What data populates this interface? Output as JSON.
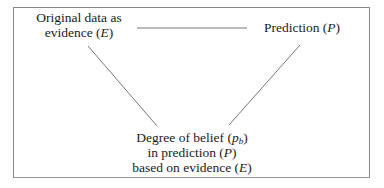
{
  "diagram": {
    "nodes": {
      "evidence": {
        "line1": "Original data as",
        "line2_prefix": "evidence (",
        "line2_var": "E",
        "line2_suffix": ")"
      },
      "prediction": {
        "prefix": "Prediction (",
        "var": "P",
        "suffix": ")"
      },
      "belief": {
        "line1_prefix": "Degree of belief (",
        "line1_var": "p",
        "line1_sub": "b",
        "line1_suffix": ")",
        "line2_prefix": "in prediction (",
        "line2_var": "P",
        "line2_suffix": ")",
        "line3_prefix": "based on evidence (",
        "line3_var": "E",
        "line3_suffix": ")"
      }
    },
    "edges": [
      {
        "from": "evidence",
        "to": "prediction",
        "x1": 137,
        "y1": 28,
        "x2": 247,
        "y2": 28
      },
      {
        "from": "evidence",
        "to": "belief",
        "x1": 88,
        "y1": 46,
        "x2": 157,
        "y2": 126
      },
      {
        "from": "prediction",
        "to": "belief",
        "x1": 300,
        "y1": 45,
        "x2": 229,
        "y2": 125
      }
    ],
    "colors": {
      "line": "#777777",
      "frame": "#888888",
      "text": "#222222"
    }
  }
}
